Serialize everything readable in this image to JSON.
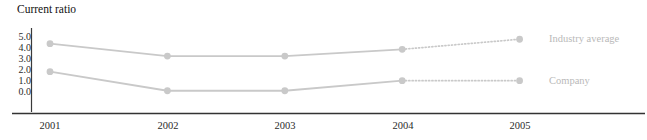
{
  "chart_data": {
    "type": "line",
    "title": "Current ratio",
    "xlabel": "",
    "ylabel": "",
    "categories": [
      "2001",
      "2002",
      "2003",
      "2004",
      "2005"
    ],
    "x_tick_labels": [
      "2001",
      "2002",
      "2003",
      "2004",
      "2005"
    ],
    "y_tick_labels": [
      "5.0",
      "4.0",
      "3.0",
      "2.0",
      "1.0",
      "0.0"
    ],
    "y_tick_values": [
      5.0,
      4.0,
      3.0,
      2.0,
      1.0,
      0.0
    ],
    "ylim": [
      0.0,
      5.0
    ],
    "grid": false,
    "legend_position": "right",
    "series": [
      {
        "name": "Industry average",
        "values": [
          4.4,
          3.3,
          3.3,
          3.9,
          4.8
        ],
        "color": "#c9c9c9",
        "marker": "circle",
        "solid_through": 4,
        "dotted_from": 4
      },
      {
        "name": "Company",
        "values": [
          1.9,
          0.2,
          0.2,
          1.1,
          1.1
        ],
        "color": "#c9c9c9",
        "marker": "circle",
        "solid_through": 4,
        "dotted_from": 4
      }
    ]
  },
  "chart": {
    "title": "Current ratio",
    "axis_color": "#333333",
    "series_color": "#c9c9c9",
    "legend_text_color": "#b9b9b9"
  },
  "y_ticks": [
    {
      "label": "5.0",
      "top": 32
    },
    {
      "label": "4.0",
      "top": 43
    },
    {
      "label": "3.0",
      "top": 54
    },
    {
      "label": "2.0",
      "top": 65
    },
    {
      "label": "1.0",
      "top": 76
    },
    {
      "label": "0.0",
      "top": 87
    }
  ],
  "x_ticks": [
    {
      "label": "2001",
      "left": 20
    },
    {
      "label": "2002",
      "left": 138
    },
    {
      "label": "2003",
      "left": 255
    },
    {
      "label": "2004",
      "left": 373
    },
    {
      "label": "2005",
      "left": 490
    }
  ],
  "legend": [
    {
      "label": "Industry average",
      "top": 33
    },
    {
      "label": "Company",
      "top": 75
    }
  ]
}
